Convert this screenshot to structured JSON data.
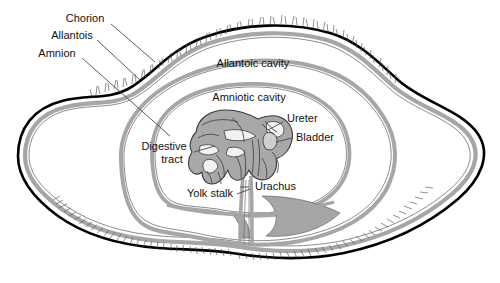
{
  "figure": {
    "type": "anatomical-diagram",
    "background_color": "#ffffff",
    "outline_color": "#000000",
    "membrane_band_color": "#a6a6a6",
    "embryo_fill_color": "#a8a8a8",
    "embryo_stroke_color": "#3a3a3a",
    "cavity_fill_color": "#ffffff",
    "leader_line_color": "#4a4a4a",
    "text_color": "#111111"
  },
  "labels": {
    "chorion": "Chorion",
    "allantois": "Allantois",
    "amnion": "Amnion",
    "allantoic_cavity": "Allantoic cavity",
    "amniotic_cavity": "Amniotic cavity",
    "ureter": "Ureter",
    "bladder": "Bladder",
    "digestive_tract_line1": "Digestive",
    "digestive_tract_line2": "tract",
    "yolk_stalk": "Yolk stalk",
    "urachus": "Urachus"
  },
  "structures": [
    {
      "name": "chorion",
      "label": "Chorion",
      "description": "outermost membrane bearing chorionic villi"
    },
    {
      "name": "allantois",
      "label": "Allantois",
      "description": "middle membrane enclosing the allantoic cavity"
    },
    {
      "name": "amnion",
      "label": "Amnion",
      "description": "innermost membrane enclosing the embryo"
    },
    {
      "name": "allantoic-cavity",
      "label": "Allantoic cavity",
      "description": "fluid space between chorion and amnion"
    },
    {
      "name": "amniotic-cavity",
      "label": "Amniotic cavity",
      "description": "fluid space immediately around the embryo"
    },
    {
      "name": "ureter",
      "label": "Ureter",
      "description": "duct from kidney to bladder"
    },
    {
      "name": "bladder",
      "label": "Bladder",
      "description": "urinary bladder of the embryo"
    },
    {
      "name": "digestive-tract",
      "label": "Digestive tract",
      "description": "embryonic gut loops"
    },
    {
      "name": "yolk-stalk",
      "label": "Yolk stalk",
      "description": "stalk connecting gut to yolk sac"
    },
    {
      "name": "urachus",
      "label": "Urachus",
      "description": "duct from bladder into the allantois"
    }
  ]
}
